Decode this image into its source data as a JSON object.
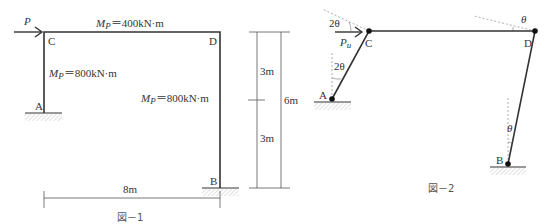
{
  "figure1": {
    "caption": "図－1",
    "load_label": "P",
    "nodes": {
      "A": "A",
      "B": "B",
      "C": "C",
      "D": "D"
    },
    "beam_label": {
      "symbol": "M",
      "sub": "P",
      "value": "＝400kN·m"
    },
    "column_left_label": {
      "symbol": "M",
      "sub": "P",
      "value": "＝800kN·m"
    },
    "column_right_label": {
      "symbol": "M",
      "sub": "P",
      "value": "＝800kN·m"
    },
    "dim_span": "8m",
    "dim_upper": "3m",
    "dim_lower": "3m",
    "dim_total": "6m"
  },
  "figure2": {
    "caption": "図－2",
    "load_label": {
      "symbol": "P",
      "sub": "u"
    },
    "nodes": {
      "A": "A",
      "B": "B",
      "C": "C",
      "D": "D"
    },
    "angle_C": "2θ",
    "angle_A": "2θ",
    "angle_D": "θ",
    "angle_B": "θ"
  },
  "colors": {
    "line": "#333333",
    "dashed": "#999999",
    "hatch": "#bbbbbb"
  }
}
